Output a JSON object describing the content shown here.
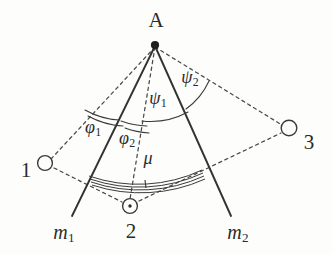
{
  "figure": {
    "background_color": "#fdfdfc",
    "stroke_color": "#3a3a3a",
    "text_color": "#2b2b2b"
  },
  "points": {
    "apex": {
      "label": "A",
      "x": 155,
      "y": 45,
      "label_x": 156,
      "label_y": 20,
      "marker": "filled-dot"
    },
    "node1": {
      "label": "1",
      "x": 45,
      "y": 163,
      "label_x": 26,
      "label_y": 170,
      "marker": "open-circle"
    },
    "node2": {
      "label": "2",
      "x": 130,
      "y": 206,
      "label_x": 131,
      "label_y": 231,
      "marker": "circle-with-center-dot"
    },
    "node3": {
      "label": "3",
      "x": 289,
      "y": 128,
      "label_x": 309,
      "label_y": 142,
      "marker": "open-circle"
    }
  },
  "rays": {
    "m1": {
      "label": "m",
      "subscript": "1",
      "label_x": 64,
      "label_y": 233,
      "from_x": 155,
      "from_y": 45,
      "to_x": 72,
      "to_y": 216,
      "style": "solid"
    },
    "m2": {
      "label": "m",
      "subscript": "2",
      "label_x": 238,
      "label_y": 233,
      "from_x": 155,
      "from_y": 45,
      "to_x": 231,
      "to_y": 216,
      "style": "solid"
    }
  },
  "angles": [
    {
      "name": "phi1",
      "label": "φ",
      "subscript": "1",
      "label_x": 93,
      "label_y": 128,
      "arc_style": "double",
      "between": [
        "A-1 dashed ray",
        "m1"
      ]
    },
    {
      "name": "phi2",
      "label": "φ",
      "subscript": "2",
      "label_x": 127,
      "label_y": 139,
      "arc_style": "double",
      "between": [
        "m1",
        "A-2 dashed ray"
      ]
    },
    {
      "name": "psi1",
      "label": "ψ",
      "subscript": "1",
      "label_x": 158,
      "label_y": 99,
      "arc_style": "single",
      "between": [
        "A-2 dashed ray",
        "m2"
      ]
    },
    {
      "name": "psi2",
      "label": "ψ",
      "subscript": "2",
      "label_x": 190,
      "label_y": 78,
      "arc_style": "single",
      "between": [
        "m2",
        "A-3 dashed ray"
      ]
    },
    {
      "name": "mu",
      "label": "μ",
      "subscript": "",
      "label_x": 148,
      "label_y": 158,
      "arc_style": "thick-multi",
      "between": [
        "m1",
        "m2"
      ]
    }
  ],
  "dashed_connections": [
    {
      "name": "apex-to-node1",
      "from": "apex",
      "to": "node1"
    },
    {
      "name": "apex-to-node2",
      "from": "apex",
      "to": "node2"
    },
    {
      "name": "apex-to-node3",
      "from": "apex",
      "to": "node3"
    },
    {
      "name": "node1-to-node2",
      "from": "node1",
      "to": "node2"
    },
    {
      "name": "node2-to-node3",
      "from": "node2",
      "to": "node3"
    }
  ]
}
